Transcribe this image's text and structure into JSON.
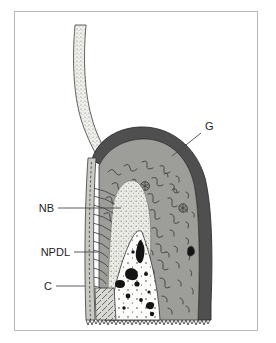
{
  "figure": {
    "caption": "",
    "frame_color": "#b9b9b9",
    "background_color": "#ffffff"
  },
  "labels": [
    {
      "key": "G",
      "text": "G",
      "x": 205,
      "y": 130,
      "anchor": "start",
      "leader": {
        "x1": 201,
        "y1": 133,
        "x2": 172,
        "y2": 156
      },
      "meaning": "gingiva"
    },
    {
      "key": "NB",
      "text": "NB",
      "x": 54,
      "y": 212,
      "anchor": "end",
      "leader": {
        "x1": 58,
        "y1": 208,
        "x2": 121,
        "y2": 208
      },
      "meaning": "new bone"
    },
    {
      "key": "NPDL",
      "text": "NPDL",
      "x": 70,
      "y": 256,
      "anchor": "end",
      "leader": {
        "x1": 74,
        "y1": 252,
        "x2": 98,
        "y2": 252
      },
      "meaning": "new periodontal ligament"
    },
    {
      "key": "C",
      "text": "C",
      "x": 52,
      "y": 290,
      "anchor": "end",
      "leader": {
        "x1": 56,
        "y1": 286,
        "x2": 85,
        "y2": 286
      },
      "meaning": "cementum"
    }
  ],
  "regions": [
    {
      "name": "tooth-root",
      "fill": "#ededea",
      "stroke": "#4a4a4a",
      "texture": "stipple-fine"
    },
    {
      "name": "gingival-epithelium",
      "fill": "#4f4f50",
      "stroke": "#2e2e2e",
      "texture": "solid"
    },
    {
      "name": "connective-tissue",
      "fill": "#9d9d99",
      "stroke": "#3a3a3a",
      "texture": "squiggle-fibers"
    },
    {
      "name": "new-bone",
      "fill": "#e9e9e4",
      "stroke": "#6a6a6a",
      "texture": "stipple-medium"
    },
    {
      "name": "marrow-space",
      "fill": "#fcfcfa",
      "stroke": "#3a3a3a",
      "texture": "stipple-sparse"
    },
    {
      "name": "cementum-strip",
      "fill": "#c9c9c4",
      "stroke": "#3a3a3a",
      "texture": "dashed-line"
    },
    {
      "name": "npdl-fibers",
      "fill": "none",
      "stroke": "#3a3a3a",
      "texture": "diagonal-lines"
    },
    {
      "name": "dentin-hatch",
      "fill": "#d7d7d2",
      "stroke": "#3a3a3a",
      "texture": "cross-hatch"
    },
    {
      "name": "osteocyte-lacuna",
      "fill": "#141414",
      "stroke": "#141414",
      "texture": "solid"
    },
    {
      "name": "blood-vessel",
      "fill": "#9d9d99",
      "stroke": "#2e2e2e",
      "texture": "ring"
    }
  ],
  "colors": {
    "epithelium_dark": "#4f4f50",
    "connective_gray": "#9d9d99",
    "root_light": "#ededea",
    "bone_light": "#e9e9e4",
    "marrow_white": "#fcfcfa",
    "cementum_gray": "#c9c9c4",
    "ink": "#2e2e2e",
    "label_ink": "#1d1d1d",
    "frame": "#b9b9b9"
  }
}
